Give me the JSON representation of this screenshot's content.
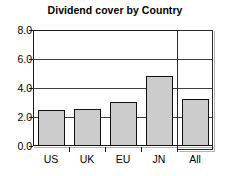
{
  "chart_data": {
    "type": "bar",
    "title": "Dividend cover by Country",
    "xlabel": "",
    "ylabel": "",
    "categories": [
      "US",
      "UK",
      "EU",
      "JN",
      "All"
    ],
    "values": [
      2.5,
      2.55,
      3.05,
      4.85,
      3.25
    ],
    "ylim": [
      0.0,
      8.0
    ],
    "ytick_values": [
      0.0,
      2.0,
      4.0,
      6.0,
      8.0
    ],
    "ytick_labels": [
      "0.0",
      "2.0",
      "4.0",
      "6.0",
      "8.0"
    ],
    "grid": true,
    "grid_axis": "y",
    "legend": false,
    "legend_position": "none",
    "bar_fill_color": "#cccccc",
    "bar_border_color": "#111111",
    "axis_color": "#1a1a1a",
    "grid_color": "#3d3d3d",
    "highlighted_category": "All",
    "annotations": []
  },
  "chart": {
    "title": "Dividend cover by Country",
    "y_axis": {
      "ticks": [
        {
          "label": "8.0",
          "value": 8.0
        },
        {
          "label": "6.0",
          "value": 6.0
        },
        {
          "label": "4.0",
          "value": 4.0
        },
        {
          "label": "2.0",
          "value": 2.0
        },
        {
          "label": "0.0",
          "value": 0.0
        }
      ]
    },
    "x_axis": {
      "ticks": [
        {
          "label": "US",
          "value": 2.5
        },
        {
          "label": "UK",
          "value": 2.55
        },
        {
          "label": "EU",
          "value": 3.05
        },
        {
          "label": "JN",
          "value": 4.85
        },
        {
          "label": "All",
          "value": 3.25
        }
      ]
    }
  }
}
